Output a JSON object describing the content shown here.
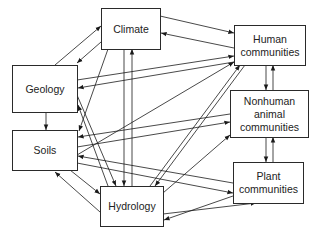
{
  "diagram": {
    "type": "directed-graph",
    "colors": {
      "line": "#1a1a1a",
      "box_border": "#2a2a2a",
      "text": "#222222",
      "background": "#ffffff"
    },
    "nodes": [
      {
        "id": "climate",
        "label": "Climate"
      },
      {
        "id": "human",
        "label": "Human communities"
      },
      {
        "id": "geology",
        "label": "Geology"
      },
      {
        "id": "nonhuman",
        "label": "Nonhuman animal communities"
      },
      {
        "id": "soils",
        "label": "Soils"
      },
      {
        "id": "plant",
        "label": "Plant communities"
      },
      {
        "id": "hydrology",
        "label": "Hydrology"
      }
    ],
    "edges": [
      {
        "from": "geology",
        "to": "climate"
      },
      {
        "from": "climate",
        "to": "geology"
      },
      {
        "from": "climate",
        "to": "human"
      },
      {
        "from": "human",
        "to": "climate"
      },
      {
        "from": "geology",
        "to": "human"
      },
      {
        "from": "human",
        "to": "geology"
      },
      {
        "from": "geology",
        "to": "soils"
      },
      {
        "from": "climate",
        "to": "soils"
      },
      {
        "from": "hydrology",
        "to": "geology"
      },
      {
        "from": "geology",
        "to": "hydrology"
      },
      {
        "from": "climate",
        "to": "hydrology"
      },
      {
        "from": "hydrology",
        "to": "climate"
      },
      {
        "from": "human",
        "to": "nonhuman"
      },
      {
        "from": "nonhuman",
        "to": "human"
      },
      {
        "from": "nonhuman",
        "to": "plant"
      },
      {
        "from": "plant",
        "to": "nonhuman"
      },
      {
        "from": "soils",
        "to": "nonhuman"
      },
      {
        "from": "nonhuman",
        "to": "soils"
      },
      {
        "from": "soils",
        "to": "human"
      },
      {
        "from": "hydrology",
        "to": "human"
      },
      {
        "from": "human",
        "to": "hydrology"
      },
      {
        "from": "hydrology",
        "to": "nonhuman"
      },
      {
        "from": "soils",
        "to": "plant"
      },
      {
        "from": "plant",
        "to": "soils"
      },
      {
        "from": "soils",
        "to": "hydrology"
      },
      {
        "from": "hydrology",
        "to": "soils"
      },
      {
        "from": "hydrology",
        "to": "plant"
      },
      {
        "from": "plant",
        "to": "hydrology"
      }
    ]
  },
  "labels": {
    "climate": "Climate",
    "human_1": "Human",
    "human_2": "communities",
    "geology": "Geology",
    "nonhuman_1": "Nonhuman",
    "nonhuman_2": "animal",
    "nonhuman_3": "communities",
    "soils": "Soils",
    "plant_1": "Plant",
    "plant_2": "communities",
    "hydrology": "Hydrology"
  }
}
